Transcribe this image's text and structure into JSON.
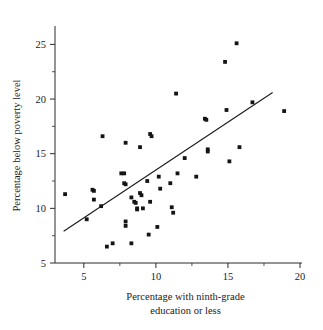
{
  "chart_data": {
    "type": "scatter",
    "title": "",
    "xlabel": "Percentage with ninth-grade education or less",
    "xlabel_line1": "Percentage with ninth-grade",
    "xlabel_line2": "education or less",
    "ylabel": "Percentage below poverty level",
    "xlim": [
      3.0,
      20.0
    ],
    "ylim": [
      5.0,
      26.5
    ],
    "xticks": [
      5,
      10,
      15,
      20
    ],
    "xtick_labels": [
      "5",
      "10",
      "15",
      "20"
    ],
    "xticks_minor": [
      2.5,
      7.5,
      12.5,
      17.5
    ],
    "yticks": [
      5,
      10,
      15,
      20,
      25
    ],
    "ytick_labels": [
      "5",
      "10",
      "15",
      "20",
      "25"
    ],
    "yticks_minor": [
      7.5,
      12.5,
      17.5,
      22.5
    ],
    "grid": false,
    "legend": "none",
    "marker": "square",
    "marker_size_px": 2.6,
    "marker_color": "#141414",
    "points": [
      [
        3.7,
        11.3
      ],
      [
        5.2,
        9.0
      ],
      [
        5.6,
        11.7
      ],
      [
        5.7,
        11.6
      ],
      [
        5.7,
        10.8
      ],
      [
        6.2,
        10.2
      ],
      [
        6.3,
        16.6
      ],
      [
        6.6,
        6.5
      ],
      [
        7.0,
        6.8
      ],
      [
        7.6,
        13.2
      ],
      [
        7.8,
        13.2
      ],
      [
        7.9,
        16.0
      ],
      [
        7.8,
        12.3
      ],
      [
        7.9,
        12.2
      ],
      [
        7.9,
        8.8
      ],
      [
        7.9,
        8.4
      ],
      [
        8.3,
        6.8
      ],
      [
        8.3,
        11.0
      ],
      [
        8.5,
        10.6
      ],
      [
        8.6,
        10.5
      ],
      [
        8.7,
        10.0
      ],
      [
        8.7,
        9.9
      ],
      [
        8.9,
        15.6
      ],
      [
        8.9,
        11.4
      ],
      [
        9.0,
        11.2
      ],
      [
        9.1,
        10.0
      ],
      [
        9.4,
        12.5
      ],
      [
        9.5,
        7.6
      ],
      [
        9.6,
        16.8
      ],
      [
        9.7,
        16.6
      ],
      [
        9.6,
        10.6
      ],
      [
        10.1,
        8.3
      ],
      [
        10.2,
        12.9
      ],
      [
        10.3,
        11.8
      ],
      [
        11.0,
        12.3
      ],
      [
        11.1,
        10.1
      ],
      [
        11.2,
        9.6
      ],
      [
        11.4,
        20.5
      ],
      [
        11.5,
        13.2
      ],
      [
        12.0,
        14.6
      ],
      [
        12.8,
        12.9
      ],
      [
        13.4,
        18.2
      ],
      [
        13.5,
        18.1
      ],
      [
        13.6,
        15.4
      ],
      [
        13.6,
        15.2
      ],
      [
        14.8,
        23.4
      ],
      [
        14.9,
        19.0
      ],
      [
        15.1,
        14.3
      ],
      [
        15.6,
        25.1
      ],
      [
        15.8,
        15.6
      ],
      [
        16.7,
        19.7
      ],
      [
        18.9,
        18.9
      ]
    ],
    "fit_line": {
      "label": "least-squares regression line",
      "x_start": 3.6,
      "y_start": 7.9,
      "x_end": 18.1,
      "y_end": 20.6
    }
  },
  "figure": {
    "background_color": "#ffffff",
    "axis_color": "#2b2b2b",
    "text_color": "#1a1a1a"
  }
}
